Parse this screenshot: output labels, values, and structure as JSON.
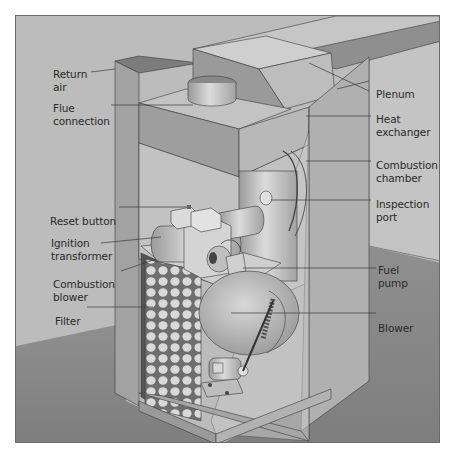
{
  "diagram": {
    "colors": {
      "background_wall": "#b9b9b9",
      "floor": "#8c8c8c",
      "cabinet_light": "#c8c8c8",
      "cabinet_mid": "#a9a9a9",
      "cabinet_dark": "#8e8e8e",
      "line": "#3a3a3a",
      "text": "#2a2a2a",
      "frame_border": "#6a6a6a"
    },
    "labels_left": [
      {
        "id": "return-air",
        "text": "Return\nair"
      },
      {
        "id": "flue-connection",
        "text": "Flue\nconnection"
      },
      {
        "id": "reset-button",
        "text": "Reset button"
      },
      {
        "id": "ignition-transformer",
        "text": "Ignition\ntransformer"
      },
      {
        "id": "combustion-blower",
        "text": "Combustion\nblower"
      },
      {
        "id": "filter",
        "text": "Filter"
      }
    ],
    "labels_right": [
      {
        "id": "plenum",
        "text": "Plenum"
      },
      {
        "id": "heat-exchanger",
        "text": "Heat\nexchanger"
      },
      {
        "id": "combustion-chamber",
        "text": "Combustion\nchamber"
      },
      {
        "id": "inspection-port",
        "text": "Inspection\nport"
      },
      {
        "id": "fuel-pump",
        "text": "Fuel\npump"
      },
      {
        "id": "blower",
        "text": "Blower"
      }
    ]
  }
}
